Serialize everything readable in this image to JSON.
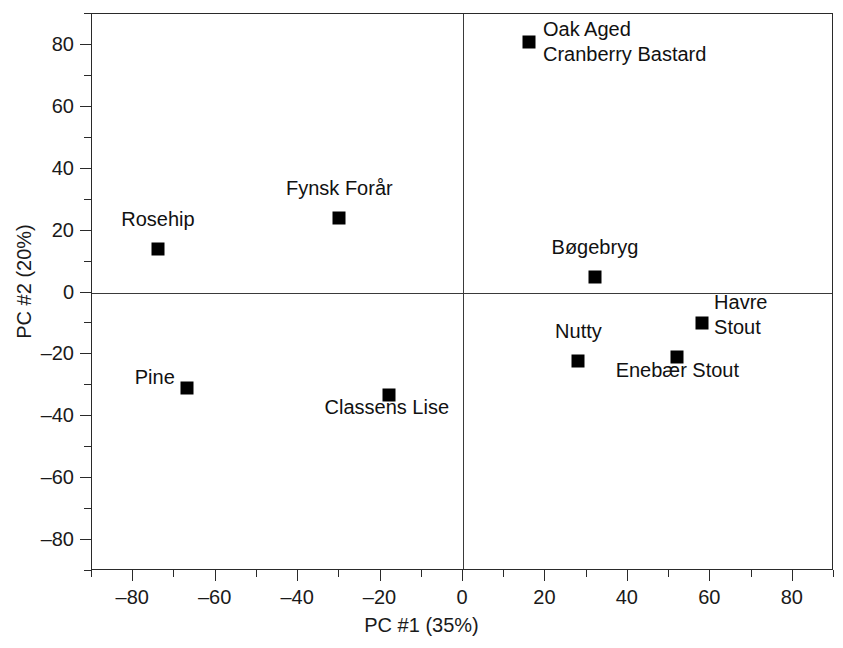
{
  "chart_data": {
    "type": "scatter",
    "title": "",
    "xlabel": "PC #1 (35%)",
    "ylabel": "PC #2 (20%)",
    "xlim": [
      -90,
      90
    ],
    "ylim": [
      -90,
      90
    ],
    "grid": false,
    "legend": "none",
    "zero_lines": true,
    "xticks": [
      -80,
      -60,
      -40,
      -20,
      0,
      20,
      40,
      60,
      80
    ],
    "xtick_labels": [
      "–80",
      "–60",
      "–40",
      "–20",
      "0",
      "20",
      "40",
      "60",
      "80"
    ],
    "yticks": [
      -80,
      -60,
      -40,
      -20,
      0,
      20,
      40,
      60,
      80
    ],
    "ytick_labels": [
      "–80",
      "–60",
      "–40",
      "–20",
      "0",
      "20",
      "40",
      "60",
      "80"
    ],
    "xminor_ticks": [
      -90,
      -70,
      -50,
      -30,
      -10,
      10,
      30,
      50,
      70,
      90
    ],
    "yminor_ticks": [
      -90,
      -70,
      -50,
      -30,
      -10,
      10,
      30,
      50,
      70,
      90
    ],
    "marker_shape": "square",
    "marker_color": "#000000",
    "points": [
      {
        "label": "Rosehip",
        "x": -74,
        "y": 14,
        "label_lines": [
          "Rosehip"
        ],
        "label_dx": 0,
        "label_dy": -30,
        "anchor": "mid"
      },
      {
        "label": "Fynsk Forår",
        "x": -30,
        "y": 24,
        "label_lines": [
          "Fynsk Forår"
        ],
        "label_dx": 0,
        "label_dy": -30,
        "anchor": "mid"
      },
      {
        "label": "Oak Aged Cranberry Bastard",
        "x": 16,
        "y": 81,
        "label_lines": [
          "Oak Aged",
          "Cranberry Bastard"
        ],
        "label_dx": 14,
        "label_dy": -13,
        "anchor": "start"
      },
      {
        "label": "Bøgebryg",
        "x": 32,
        "y": 5,
        "label_lines": [
          "Bøgebryg"
        ],
        "label_dx": 0,
        "label_dy": -30,
        "anchor": "mid"
      },
      {
        "label": "Havre Stout",
        "x": 58,
        "y": -10,
        "label_lines": [
          "Havre",
          "Stout"
        ],
        "label_dx": 12,
        "label_dy": -21,
        "anchor": "start"
      },
      {
        "label": "Enebær Stout",
        "x": 52,
        "y": -21,
        "label_lines": [
          "Enebær Stout"
        ],
        "label_dx": 0,
        "label_dy": 13,
        "anchor": "mid"
      },
      {
        "label": "Nutty",
        "x": 28,
        "y": -22,
        "label_lines": [
          "Nutty"
        ],
        "label_dx": 0,
        "label_dy": -30,
        "anchor": "mid"
      },
      {
        "label": "Pine",
        "x": -67,
        "y": -31,
        "label_lines": [
          "Pine"
        ],
        "label_dx": -12,
        "label_dy": -11,
        "anchor": "end"
      },
      {
        "label": "Classens Lise",
        "x": -18,
        "y": -33,
        "label_lines": [
          "Classens Lise"
        ],
        "label_dx": -2,
        "label_dy": 12,
        "anchor": "mid"
      }
    ]
  }
}
